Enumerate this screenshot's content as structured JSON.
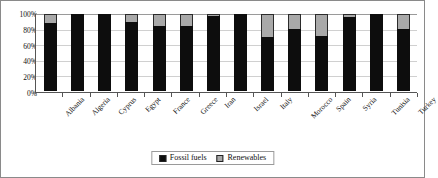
{
  "chart_data": {
    "type": "bar",
    "stacked": true,
    "title": "",
    "xlabel": "",
    "ylabel": "",
    "ylim": [
      0,
      100
    ],
    "ytick_labels": [
      "100%",
      "80%",
      "60%",
      "40%",
      "20%",
      "0%"
    ],
    "ytick_values": [
      100,
      80,
      60,
      40,
      20,
      0
    ],
    "grid": true,
    "legend_position": "bottom-center",
    "categories": [
      "Albania",
      "Algeria",
      "Cyprus",
      "Egypt",
      "France",
      "Greece",
      "Iran",
      "Israel",
      "Italy",
      "Morocco",
      "Spain",
      "Syria",
      "Tunisia",
      "Turkey"
    ],
    "series": [
      {
        "name": "Fossil fuels",
        "color": "#0d0d0d",
        "values": [
          88,
          100,
          100,
          89,
          85,
          85,
          97,
          100,
          70,
          81,
          72,
          96,
          100,
          80
        ]
      },
      {
        "name": "Renewables",
        "color": "#a9a9a9",
        "values": [
          12,
          0,
          0,
          11,
          15,
          15,
          3,
          0,
          30,
          19,
          28,
          4,
          0,
          20
        ]
      }
    ]
  },
  "legend": {
    "items": [
      {
        "label": "Fossil fuels",
        "swatch": "black-square-icon"
      },
      {
        "label": "Renewables",
        "swatch": "gray-square-icon"
      }
    ]
  },
  "colors": {
    "fossil": "#0d0d0d",
    "renewables": "#a9a9a9",
    "axis": "#555555",
    "grid": "#d0d0d0",
    "frame": "#8a8a8a",
    "background": "#ffffff"
  }
}
